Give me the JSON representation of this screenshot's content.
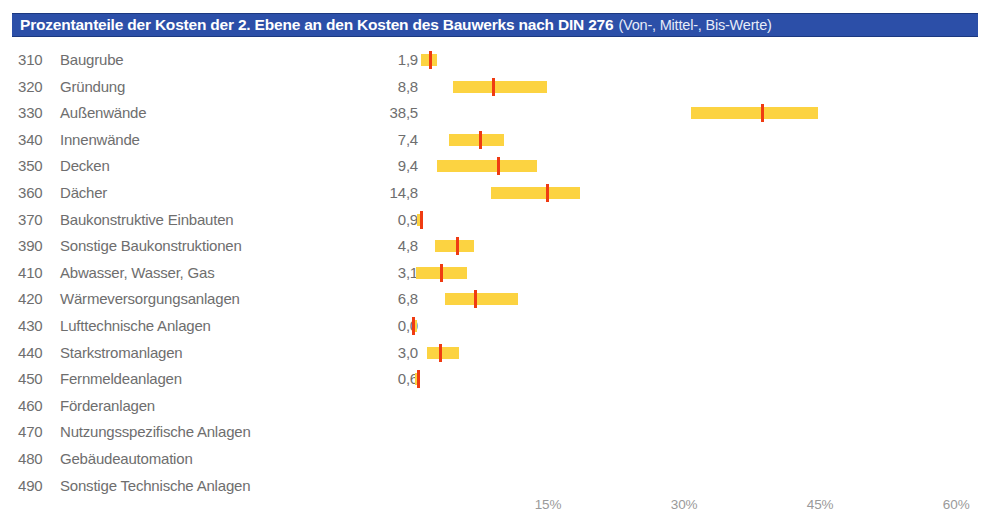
{
  "title": {
    "main": "Prozentanteile der Kosten der 2. Ebene an den Kosten des Bauwerks nach DIN 276",
    "sub": "(Von-, Mittel-, Bis-Werte)",
    "bar_color": "#2c4fa8"
  },
  "colors": {
    "range_bar": "#fcd341",
    "mid_marker": "#ef3b12",
    "text": "#6e6e6e",
    "axis_text": "#9a9a9a"
  },
  "chart_data": {
    "type": "bar",
    "title": "Prozentanteile der Kosten der 2. Ebene an den Kosten des Bauwerks nach DIN 276 (Von-, Mittel-, Bis-Werte)",
    "xlabel": "",
    "ylabel": "",
    "xlim": [
      0,
      66
    ],
    "grid": false,
    "legend": null,
    "xticks": [
      15,
      30,
      45,
      60
    ],
    "xticklabels": [
      "15%",
      "30%",
      "45%",
      "60%"
    ],
    "categories": [
      "310 Baugrube",
      "320 Gründung",
      "330 Außenwände",
      "340 Innenwände",
      "350 Decken",
      "360 Dächer",
      "370 Baukonstruktive Einbauten",
      "390 Sonstige Baukonstruktionen",
      "410 Abwasser, Wasser, Gas",
      "420 Wärmeversorgungsanlagen",
      "430 Lufttechnische Anlagen",
      "440 Starkstromanlagen",
      "450 Fernmeldeanlagen",
      "460 Förderanlagen",
      "470 Nutzungsspezifische Anlagen",
      "480 Gebäudeautomation",
      "490 Sonstige Technische Anlagen"
    ],
    "series": [
      {
        "name": "Von-Wert",
        "values": [
          1.0,
          4.5,
          30.8,
          4.1,
          2.8,
          8.7,
          0.6,
          2.5,
          0.4,
          3.6,
          0.0,
          1.7,
          0.3,
          null,
          null,
          null,
          null
        ]
      },
      {
        "name": "Mittel-Wert",
        "values": [
          1.9,
          8.8,
          38.5,
          7.4,
          9.4,
          14.8,
          0.9,
          4.8,
          3.1,
          6.8,
          0.0,
          3.0,
          0.6,
          null,
          null,
          null,
          null
        ]
      },
      {
        "name": "Bis-Wert",
        "values": [
          2.8,
          14.9,
          44.8,
          10.2,
          13.8,
          18.5,
          1.1,
          6.8,
          6.1,
          11.7,
          0.6,
          5.2,
          0.9,
          null,
          null,
          null,
          null
        ]
      }
    ]
  },
  "rows": [
    {
      "code": "310",
      "label": "Baugrube",
      "value": "1,9",
      "von": 1.0,
      "mittel": 1.9,
      "bis": 2.8,
      "has_bar": true
    },
    {
      "code": "320",
      "label": "Gründung",
      "value": "8,8",
      "von": 4.5,
      "mittel": 8.8,
      "bis": 14.9,
      "has_bar": true
    },
    {
      "code": "330",
      "label": "Außenwände",
      "value": "38,5",
      "von": 30.8,
      "mittel": 38.5,
      "bis": 44.8,
      "has_bar": true
    },
    {
      "code": "340",
      "label": "Innenwände",
      "value": "7,4",
      "von": 4.1,
      "mittel": 7.4,
      "bis": 10.2,
      "has_bar": true
    },
    {
      "code": "350",
      "label": "Decken",
      "value": "9,4",
      "von": 2.8,
      "mittel": 9.4,
      "bis": 13.8,
      "has_bar": true
    },
    {
      "code": "360",
      "label": "Dächer",
      "value": "14,8",
      "von": 8.7,
      "mittel": 14.8,
      "bis": 18.5,
      "has_bar": true
    },
    {
      "code": "370",
      "label": "Baukonstruktive Einbauten",
      "value": "0,9",
      "von": 0.6,
      "mittel": 0.9,
      "bis": 1.1,
      "has_bar": true
    },
    {
      "code": "390",
      "label": "Sonstige Baukonstruktionen",
      "value": "4,8",
      "von": 2.5,
      "mittel": 4.8,
      "bis": 6.8,
      "has_bar": true
    },
    {
      "code": "410",
      "label": "Abwasser, Wasser, Gas",
      "value": "3,1",
      "von": 0.4,
      "mittel": 3.1,
      "bis": 6.1,
      "has_bar": true
    },
    {
      "code": "420",
      "label": "Wärmeversorgungsanlagen",
      "value": "6,8",
      "von": 3.6,
      "mittel": 6.8,
      "bis": 11.7,
      "has_bar": true
    },
    {
      "code": "430",
      "label": "Lufttechnische Anlagen",
      "value": "0,0",
      "von": 0.0,
      "mittel": 0.0,
      "bis": 0.6,
      "has_bar": true
    },
    {
      "code": "440",
      "label": "Starkstromanlagen",
      "value": "3,0",
      "von": 1.7,
      "mittel": 3.0,
      "bis": 5.2,
      "has_bar": true
    },
    {
      "code": "450",
      "label": "Fernmeldeanlagen",
      "value": "0,6",
      "von": 0.3,
      "mittel": 0.6,
      "bis": 0.9,
      "has_bar": true
    },
    {
      "code": "460",
      "label": "Förderanlagen",
      "value": "",
      "von": null,
      "mittel": null,
      "bis": null,
      "has_bar": false
    },
    {
      "code": "470",
      "label": "Nutzungsspezifische Anlagen",
      "value": "",
      "von": null,
      "mittel": null,
      "bis": null,
      "has_bar": false
    },
    {
      "code": "480",
      "label": "Gebäudeautomation",
      "value": "",
      "von": null,
      "mittel": null,
      "bis": null,
      "has_bar": false
    },
    {
      "code": "490",
      "label": "Sonstige Technische Anlagen",
      "value": "",
      "von": null,
      "mittel": null,
      "bis": null,
      "has_bar": false
    }
  ],
  "axis": {
    "ticks": [
      {
        "label": "15%",
        "value": 15
      },
      {
        "label": "30%",
        "value": 30
      },
      {
        "label": "45%",
        "value": 45
      },
      {
        "label": "60%",
        "value": 60
      }
    ]
  },
  "geometry": {
    "origin_x": 412,
    "px_per_percent": 9.07,
    "row_height": 26.6,
    "first_row_top": 6
  }
}
